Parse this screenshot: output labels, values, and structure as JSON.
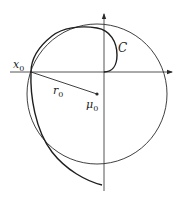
{
  "diagram": {
    "colors": {
      "stroke": "#2a2a2a",
      "background": "#ffffff"
    },
    "axes": {
      "origin": [
        104,
        72
      ],
      "horizontal": {
        "x1": 10,
        "x2": 172,
        "y": 72
      },
      "vertical": {
        "x": 104,
        "y1": 191,
        "y2": 14
      }
    },
    "circle": {
      "cx": 97,
      "cy": 94,
      "r": 70
    },
    "center_point": {
      "x": 97,
      "y": 94
    },
    "radius_line": {
      "from": [
        31,
        72
      ],
      "to": [
        97,
        94
      ]
    },
    "labels": {
      "curve": "C",
      "start_point": "x",
      "start_point_sub": "0",
      "radius": "r",
      "radius_sub": "0",
      "center": "μ",
      "center_sub": "0"
    }
  }
}
